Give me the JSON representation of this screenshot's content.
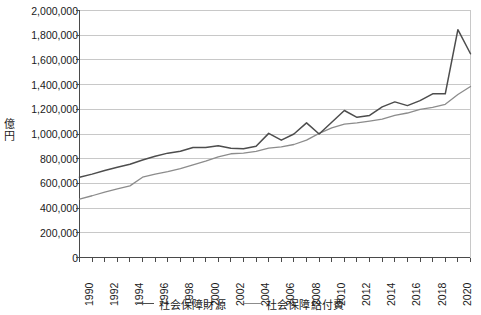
{
  "chart_data": {
    "type": "line",
    "title": "",
    "xlabel": "",
    "ylabel": "億円",
    "ylim": [
      0,
      2000000
    ],
    "ytick_step": 200000,
    "yticks": [
      0,
      200000,
      400000,
      600000,
      800000,
      1000000,
      1200000,
      1400000,
      1600000,
      1800000,
      2000000
    ],
    "ytick_labels": [
      "0",
      "200,000",
      "400,000",
      "600,000",
      "800,000",
      "1,000,000",
      "1,200,000",
      "1,400,000",
      "1,600,000",
      "1,800,000",
      "2,000,000"
    ],
    "xlim": [
      1990,
      2021
    ],
    "xticks_all": [
      1990,
      1991,
      1992,
      1993,
      1994,
      1995,
      1996,
      1997,
      1998,
      1999,
      2000,
      2001,
      2002,
      2003,
      2004,
      2005,
      2006,
      2007,
      2008,
      2009,
      2010,
      2011,
      2012,
      2013,
      2014,
      2015,
      2016,
      2017,
      2018,
      2019,
      2020,
      2021
    ],
    "xtick_labels": [
      "1990",
      "1992",
      "1994",
      "1996",
      "1998",
      "2000",
      "2002",
      "2004",
      "2006",
      "2008",
      "2010",
      "2012",
      "2014",
      "2016",
      "2018",
      "2020"
    ],
    "xtick_labelled_years": [
      1990,
      1992,
      1994,
      1996,
      1998,
      2000,
      2002,
      2004,
      2006,
      2008,
      2010,
      2012,
      2014,
      2016,
      2018,
      2020
    ],
    "grid": true,
    "grid_axis": "y",
    "legend_position": "bottom",
    "x": [
      1990,
      1991,
      1992,
      1993,
      1994,
      1995,
      1996,
      1997,
      1998,
      1999,
      2000,
      2001,
      2002,
      2003,
      2004,
      2005,
      2006,
      2007,
      2008,
      2009,
      2010,
      2011,
      2012,
      2013,
      2014,
      2015,
      2016,
      2017,
      2018,
      2019,
      2020,
      2021
    ],
    "series": [
      {
        "name": "社会保障財源",
        "color": "#4d4d4d",
        "values": [
          650000,
          675000,
          705000,
          730000,
          755000,
          790000,
          820000,
          845000,
          860000,
          890000,
          890000,
          905000,
          885000,
          880000,
          900000,
          1005000,
          950000,
          1000000,
          1090000,
          1000000,
          1095000,
          1190000,
          1135000,
          1150000,
          1220000,
          1260000,
          1230000,
          1270000,
          1325000,
          1325000,
          1845000,
          1650000
        ]
      },
      {
        "name": "社会保障給付費",
        "color": "#8c8c8c",
        "values": [
          473000,
          500000,
          530000,
          555000,
          580000,
          650000,
          675000,
          695000,
          720000,
          750000,
          780000,
          815000,
          840000,
          845000,
          860000,
          885000,
          895000,
          915000,
          950000,
          1005000,
          1050000,
          1080000,
          1090000,
          1105000,
          1120000,
          1150000,
          1170000,
          1200000,
          1215000,
          1240000,
          1320000,
          1385000
        ]
      }
    ]
  },
  "axis": {
    "unit_chars": [
      "億",
      "円"
    ]
  },
  "legend": {
    "items": [
      {
        "label": "社会保障財源",
        "color": "#4d4d4d"
      },
      {
        "label": "社会保障給付費",
        "color": "#8c8c8c"
      }
    ]
  },
  "colors": {
    "grid": "#c8c8c8",
    "axis": "#4a4a4a",
    "text": "#1a1a1a",
    "background": "#ffffff",
    "series_1": "#4d4d4d",
    "series_2": "#8c8c8c"
  }
}
